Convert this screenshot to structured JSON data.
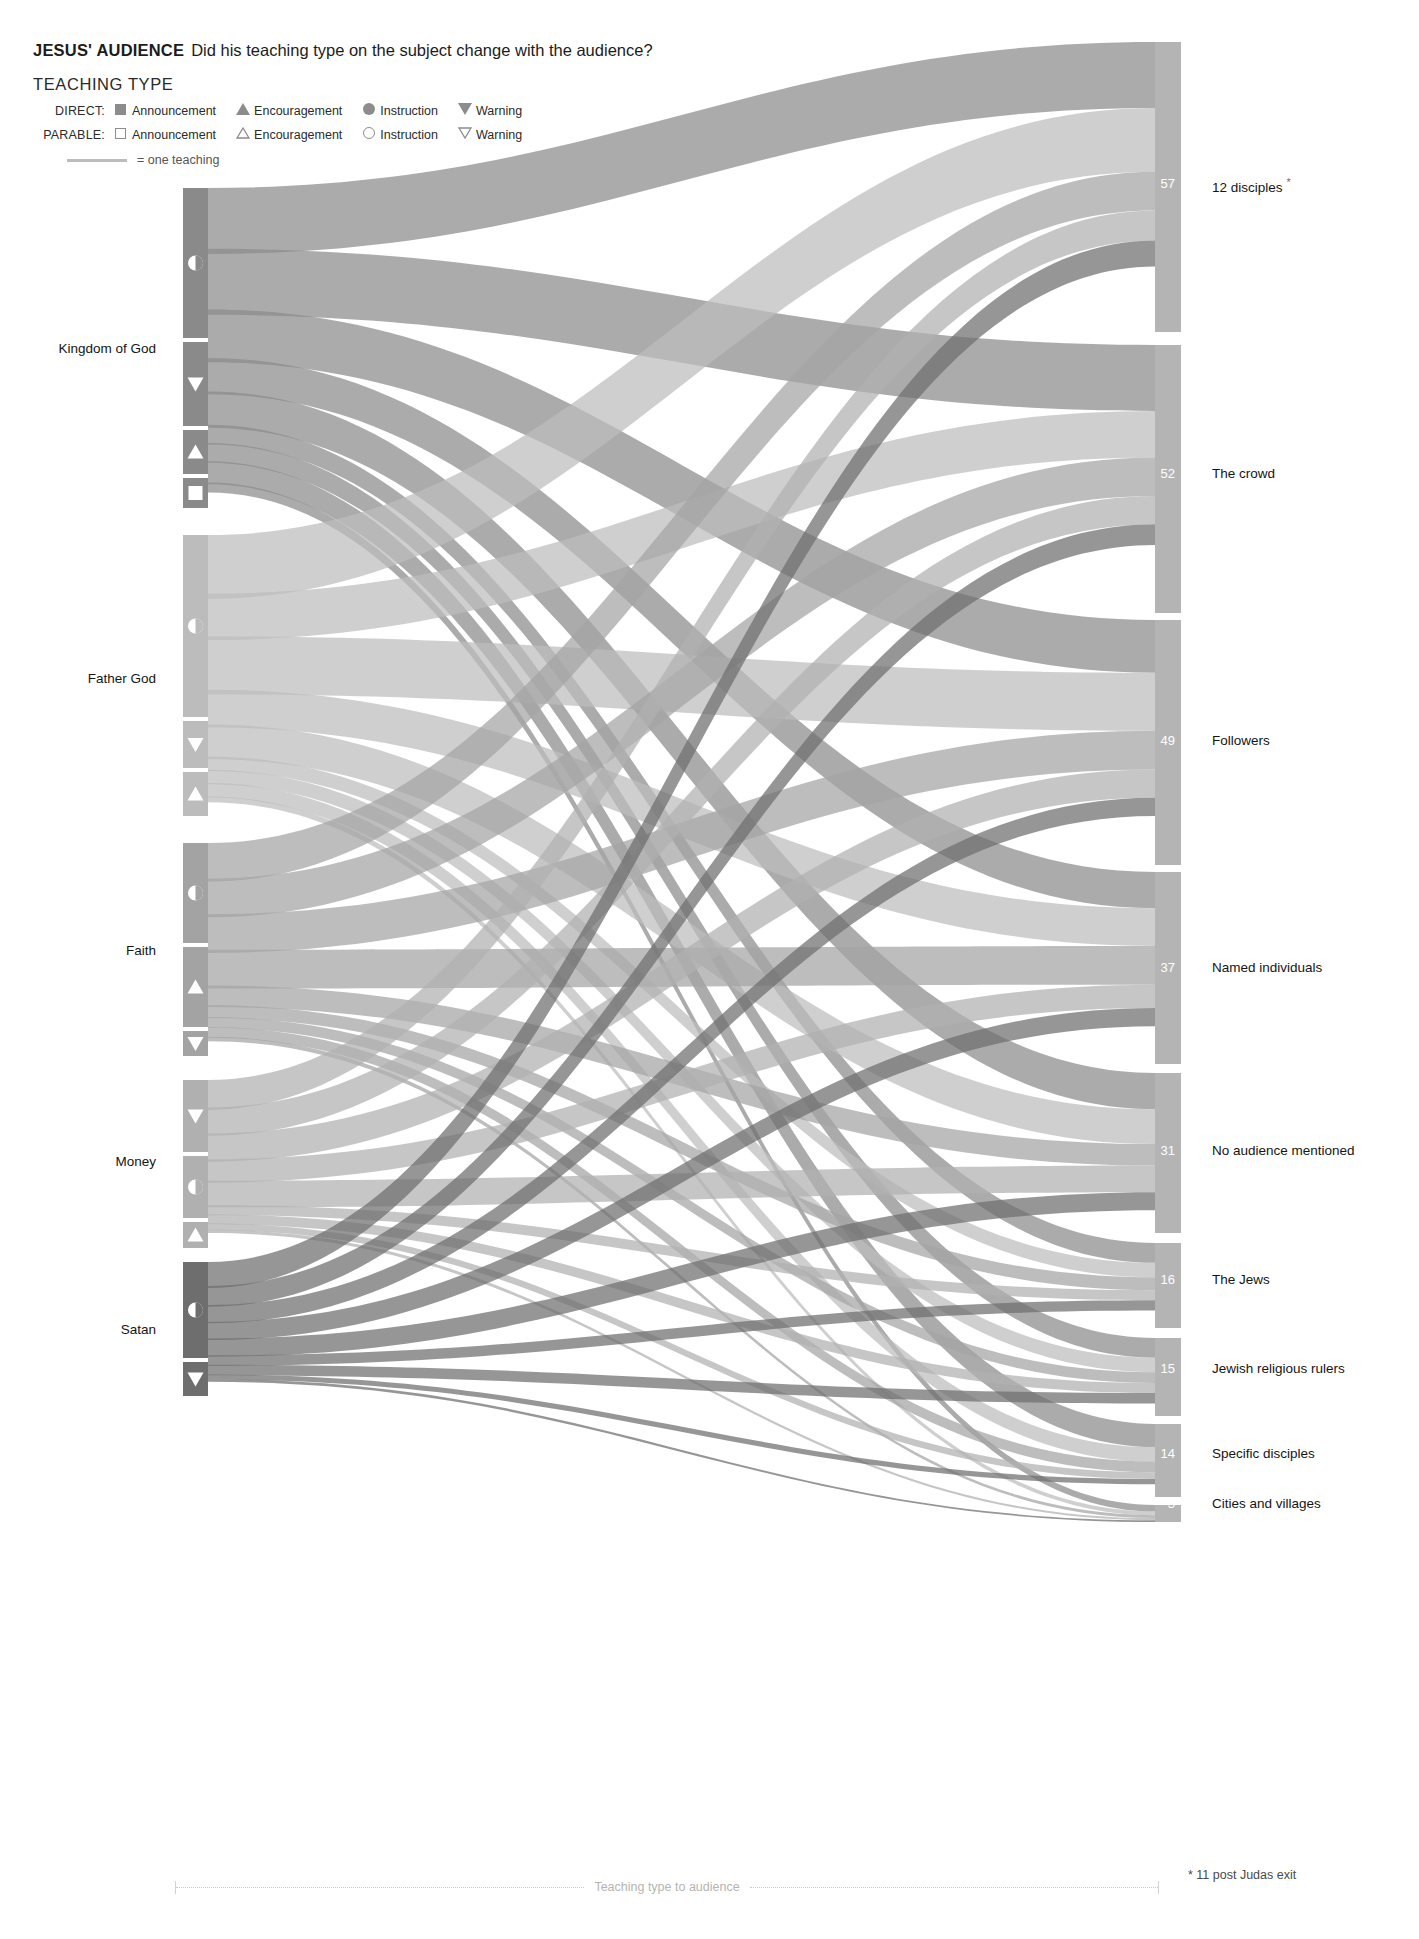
{
  "header": {
    "title_main": "JESUS' AUDIENCE",
    "title_sub": "Did his teaching type on the subject change with the audience?",
    "legend_title": "TEACHING TYPE",
    "direct_label": "DIRECT:",
    "parable_label": "PARABLE:",
    "types": [
      "Announcement",
      "Encouragement",
      "Instruction",
      "Warning"
    ],
    "unit_note": "= one teaching"
  },
  "axis_caption": "Teaching type to audience",
  "footnote": "* 11 post Judas exit",
  "star": "*",
  "colors": {
    "kingdom_of_god": "#8a8a8a",
    "father_god": "#bcbcbc",
    "faith": "#a3a3a3",
    "money": "#b0b0b0",
    "satan": "#6e6e6e",
    "audience_node": "#b4b4b4",
    "background": "#ffffff",
    "text": "#1c1c1c"
  },
  "chart_data": {
    "type": "sankey",
    "title": "JESUS' AUDIENCE",
    "subtitle": "Did his teaching type on the subject change with the audience?",
    "xlabel": "Teaching type to audience",
    "unit": "one teaching",
    "legend": {
      "groups": [
        "DIRECT",
        "PARABLE"
      ],
      "entries": [
        "Announcement",
        "Encouragement",
        "Instruction",
        "Warning"
      ],
      "marker_map": {
        "DIRECT-Announcement": "filled-square",
        "DIRECT-Encouragement": "filled-triangle-up",
        "DIRECT-Instruction": "filled-circle",
        "DIRECT-Warning": "filled-triangle-down",
        "PARABLE-Announcement": "outline-square",
        "PARABLE-Encouragement": "outline-triangle-up",
        "PARABLE-Instruction": "outline-circle",
        "PARABLE-Warning": "outline-triangle-down"
      }
    },
    "source_nodes": [
      {
        "id": "kingdom",
        "label": "Kingdom of God",
        "value": 94,
        "color": "#8a8a8a",
        "y": 188,
        "height": 330,
        "label_y": 350,
        "segments": [
          {
            "type": "Instruction",
            "marker": "half-circle",
            "value": 47,
            "offset": 0,
            "height": 150
          },
          {
            "type": "Warning",
            "marker": "triangle-down",
            "value": 25,
            "offset": 154,
            "height": 84
          },
          {
            "type": "Encouragement",
            "marker": "triangle-up",
            "value": 13,
            "offset": 242,
            "height": 44
          },
          {
            "type": "Announcement",
            "marker": "square",
            "value": 9,
            "offset": 290,
            "height": 30
          }
        ]
      },
      {
        "id": "father",
        "label": "Father God",
        "value": 91,
        "color": "#bcbcbc",
        "y": 535,
        "height": 290,
        "label_y": 680,
        "segments": [
          {
            "type": "Instruction",
            "marker": "half-circle",
            "value": 56,
            "offset": 0,
            "height": 182
          },
          {
            "type": "Warning",
            "marker": "triangle-down",
            "value": 14,
            "offset": 186,
            "height": 47
          },
          {
            "type": "Encouragement",
            "marker": "triangle-up",
            "value": 13,
            "offset": 237,
            "height": 44
          }
        ]
      },
      {
        "id": "faith",
        "label": "Faith",
        "value": 63,
        "color": "#a3a3a3",
        "y": 843,
        "height": 215,
        "label_y": 952,
        "segments": [
          {
            "type": "Instruction",
            "marker": "half-circle",
            "value": 30,
            "offset": 0,
            "height": 100
          },
          {
            "type": "Encouragement",
            "marker": "triangle-up",
            "value": 24,
            "offset": 104,
            "height": 80
          },
          {
            "type": "Warning",
            "marker": "triangle-down",
            "value": 7,
            "offset": 188,
            "height": 25
          }
        ]
      },
      {
        "id": "money",
        "label": "Money",
        "value": 53,
        "color": "#b0b0b0",
        "y": 1080,
        "height": 166,
        "label_y": 1163,
        "segments": [
          {
            "type": "Warning",
            "marker": "triangle-down",
            "value": 22,
            "offset": 0,
            "height": 72
          },
          {
            "type": "Instruction",
            "marker": "half-circle",
            "value": 19,
            "offset": 76,
            "height": 62
          },
          {
            "type": "Encouragement",
            "marker": "triangle-up",
            "value": 8,
            "offset": 142,
            "height": 26
          }
        ]
      },
      {
        "id": "satan",
        "label": "Satan",
        "value": 42,
        "color": "#6e6e6e",
        "y": 1262,
        "height": 130,
        "label_y": 1331,
        "segments": [
          {
            "type": "Instruction",
            "marker": "half-circle",
            "value": 30,
            "offset": 0,
            "height": 96
          },
          {
            "type": "Warning",
            "marker": "triangle-down",
            "value": 11,
            "offset": 100,
            "height": 34
          }
        ]
      }
    ],
    "target_nodes": [
      {
        "id": "disciples12",
        "label": "12 disciples",
        "value": 57,
        "y": 42,
        "height": 290,
        "label_y": 185,
        "has_star": true
      },
      {
        "id": "crowd",
        "label": "The crowd",
        "value": 52,
        "y": 345,
        "height": 268,
        "label_y": 475,
        "has_star": false
      },
      {
        "id": "followers",
        "label": "Followers",
        "value": 49,
        "y": 620,
        "height": 245,
        "label_y": 742,
        "has_star": false
      },
      {
        "id": "named",
        "label": "Named individuals",
        "value": 37,
        "y": 872,
        "height": 192,
        "label_y": 969,
        "has_star": false
      },
      {
        "id": "noaudience",
        "label": "No audience mentioned",
        "value": 31,
        "y": 1073,
        "height": 160,
        "label_y": 1152,
        "has_star": false
      },
      {
        "id": "jews",
        "label": "The Jews",
        "value": 16,
        "y": 1243,
        "height": 85,
        "label_y": 1281,
        "has_star": false
      },
      {
        "id": "rulers",
        "label": "Jewish religious rulers",
        "value": 15,
        "y": 1338,
        "height": 78,
        "label_y": 1370,
        "has_star": false
      },
      {
        "id": "specific",
        "label": "Specific disciples",
        "value": 14,
        "y": 1424,
        "height": 73,
        "label_y": 1455,
        "has_star": false
      },
      {
        "id": "cities",
        "label": "Cities and villages",
        "value": 3,
        "y": 1505,
        "height": 17,
        "label_y": 1505,
        "has_star": false
      }
    ],
    "notes": [
      "* 11 post Judas exit"
    ]
  }
}
